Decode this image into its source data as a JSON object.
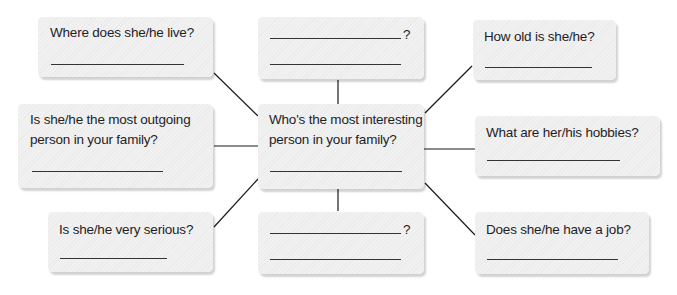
{
  "diagram": {
    "type": "word-web",
    "center": {
      "line1": "Who's the most interesting",
      "line2": "person in your family?"
    },
    "nodes": [
      {
        "id": "top-left",
        "line1": "Where does she/he live?",
        "line2": ""
      },
      {
        "id": "top-center",
        "line1": "",
        "line2": "",
        "question_mark": "?"
      },
      {
        "id": "top-right",
        "line1": "How old is she/he?",
        "line2": ""
      },
      {
        "id": "mid-left",
        "line1": "Is she/he the most outgoing",
        "line2": "person in your family?"
      },
      {
        "id": "mid-right",
        "line1": "What are her/his hobbies?",
        "line2": ""
      },
      {
        "id": "bottom-left",
        "line1": "Is she/he very serious?",
        "line2": ""
      },
      {
        "id": "bottom-center",
        "line1": "",
        "line2": "",
        "question_mark": "?"
      },
      {
        "id": "bottom-right",
        "line1": "Does she/he have a job?",
        "line2": ""
      }
    ],
    "colors": {
      "box_fill": "#eeeeee",
      "text": "#1e1e1e",
      "connector": "#1a1a1a"
    }
  }
}
